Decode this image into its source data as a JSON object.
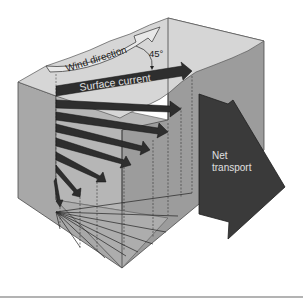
{
  "diagram": {
    "labels": {
      "wind_direction": "Wind direction",
      "angle": "45°",
      "surface_current": "Surface current",
      "net_transport_line1": "Net",
      "net_transport_line2": "transport"
    },
    "colors": {
      "background": "#ffffff",
      "top_surface": "#d4d4d4",
      "left_face": "#a6a6a6",
      "right_face": "#9a9a9a",
      "inner_panel": "#b4b4b4",
      "arrow_dark": "#2e2e2e",
      "net_arrow": "#3a3a3a",
      "wind_arrow_fill": "#e6e6e6",
      "text_light": "#e0e0e0",
      "text_dark": "#222222",
      "divider": "#9a9a9a"
    },
    "spiral_layers": 9
  }
}
